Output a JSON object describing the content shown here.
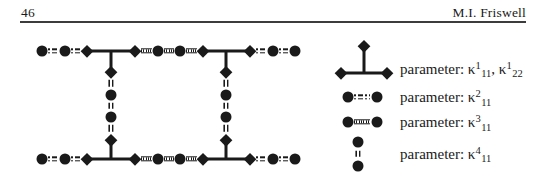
{
  "header": {
    "page_number": "46",
    "author": "M.I. Friswell"
  },
  "figure": {
    "row_symbols": [
      "circle",
      "circle",
      "diamond",
      "diamond",
      "circle",
      "circle",
      "diamond",
      "diamond",
      "circle",
      "circle"
    ],
    "row_connectors": [
      "dashdot",
      "dashdot",
      "tbar",
      "dotted",
      "dotted",
      "dotted",
      "tbar",
      "dashdot",
      "dashdot"
    ],
    "chain_symbols": [
      "diamond",
      "circle",
      "circle",
      "diamond"
    ],
    "chain_connectors": [
      "vdash",
      "vdash",
      "vdash"
    ]
  },
  "legend": {
    "rows": [
      {
        "symbol": "tee-joint-symbol",
        "segments": [
          {
            "t": "text",
            "v": "parameter: κ"
          },
          {
            "t": "sup",
            "v": "1"
          },
          {
            "t": "sub",
            "v": "11"
          },
          {
            "t": "text",
            "v": ", κ"
          },
          {
            "t": "sup",
            "v": "1"
          },
          {
            "t": "sub",
            "v": "22"
          }
        ]
      },
      {
        "symbol": "dashdot-link-symbol",
        "segments": [
          {
            "t": "text",
            "v": "parameter: κ"
          },
          {
            "t": "sup",
            "v": "2"
          },
          {
            "t": "sub",
            "v": "11"
          }
        ]
      },
      {
        "symbol": "dotted-link-symbol",
        "segments": [
          {
            "t": "text",
            "v": "parameter: κ"
          },
          {
            "t": "sup",
            "v": "3"
          },
          {
            "t": "sub",
            "v": "11"
          }
        ]
      },
      {
        "symbol": "vdash-link-symbol",
        "segments": [
          {
            "t": "text",
            "v": "parameter: κ"
          },
          {
            "t": "sup",
            "v": "4"
          },
          {
            "t": "sub",
            "v": "11"
          }
        ]
      }
    ]
  },
  "colors": {
    "ink": "#1a1a1a",
    "paper": "#ffffff",
    "rule": "#3c3c3c"
  }
}
